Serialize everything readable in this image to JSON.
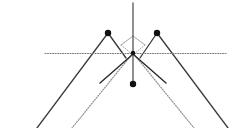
{
  "figure": {
    "type": "ray-diagram",
    "title": "",
    "width": 237,
    "height": 128,
    "background": "#ffffff"
  },
  "colors": {
    "solid_ray": "#3a3a3a",
    "dark_ray": "#2b2b2b",
    "dotted_ray": "#8f8f8f",
    "axis_dotted": "#7a7a7a",
    "vertical_axis": "#555555",
    "marker_fill": "#111111",
    "diamond_stroke": "#9a9a9a"
  },
  "chart_data": {
    "type": "scatter",
    "title": "",
    "xlabel": "",
    "ylabel": "",
    "xlim": [
      0,
      237
    ],
    "ylim": [
      128,
      0
    ],
    "grid": false,
    "legend": null,
    "vertex": {
      "x": 133,
      "y": 53
    },
    "points": [
      {
        "name": "upper-left-source",
        "x": 108,
        "y": 33,
        "r": 3.2
      },
      {
        "name": "upper-right-source",
        "x": 157,
        "y": 33,
        "r": 3.2
      },
      {
        "name": "lower-center-focus",
        "x": 133,
        "y": 84,
        "r": 3.2
      }
    ],
    "axes": {
      "vertical_axis": {
        "x": 133,
        "y_top": 3,
        "y_bottom": 84
      },
      "horizontal_axis": {
        "y": 53.5,
        "x_left": 45,
        "x_right": 226,
        "style": "dotted"
      }
    },
    "rays": [
      {
        "name": "solid-left-outer",
        "x1": 108,
        "y1": 33,
        "x2": 37,
        "y2": 128,
        "style": "solid",
        "color": "#3a3a3a",
        "width": 1.3
      },
      {
        "name": "solid-right-outer",
        "x1": 157,
        "y1": 33,
        "x2": 228,
        "y2": 128,
        "style": "solid",
        "color": "#3a3a3a",
        "width": 1.3
      },
      {
        "name": "solid-left-upper-cross",
        "x1": 108,
        "y1": 33,
        "x2": 126,
        "y2": 58,
        "style": "solid",
        "color": "#3a3a3a",
        "width": 1.3
      },
      {
        "name": "solid-right-upper-cross",
        "x1": 157,
        "y1": 33,
        "x2": 140,
        "y2": 58,
        "style": "solid",
        "color": "#3a3a3a",
        "width": 1.3
      },
      {
        "name": "diamond-left-edge",
        "x1": 121,
        "y1": 45,
        "x2": 133,
        "y2": 36,
        "style": "solid",
        "color": "#9a9a9a",
        "width": 0.9
      },
      {
        "name": "diamond-right-edge",
        "x1": 145,
        "y1": 45,
        "x2": 133,
        "y2": 36,
        "style": "solid",
        "color": "#9a9a9a",
        "width": 0.9
      },
      {
        "name": "diamond-left-lower",
        "x1": 121,
        "y1": 45,
        "x2": 133,
        "y2": 55,
        "style": "dotted",
        "color": "#9a9a9a",
        "width": 0.9
      },
      {
        "name": "diamond-right-lower",
        "x1": 145,
        "y1": 45,
        "x2": 133,
        "y2": 55,
        "style": "dotted",
        "color": "#9a9a9a",
        "width": 0.9
      },
      {
        "name": "dotted-left-fan",
        "x1": 133,
        "y1": 53,
        "x2": 72,
        "y2": 128,
        "style": "dotted",
        "color": "#8f8f8f",
        "width": 1.2
      },
      {
        "name": "dotted-right-fan",
        "x1": 133,
        "y1": 53,
        "x2": 194,
        "y2": 128,
        "style": "dotted",
        "color": "#8f8f8f",
        "width": 1.2
      },
      {
        "name": "dark-left-stub",
        "x1": 132,
        "y1": 55,
        "x2": 100,
        "y2": 83,
        "style": "solid",
        "color": "#2b2b2b",
        "width": 1.4
      },
      {
        "name": "dark-right-stub",
        "x1": 134,
        "y1": 55,
        "x2": 166,
        "y2": 83,
        "style": "solid",
        "color": "#2b2b2b",
        "width": 1.4
      }
    ]
  }
}
